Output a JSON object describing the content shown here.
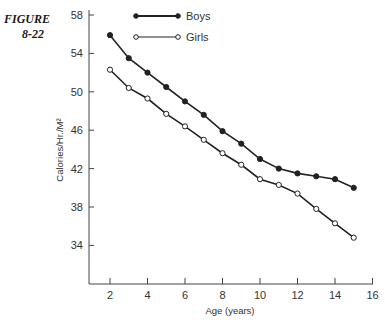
{
  "figure": {
    "label_line1": "FIGURE",
    "label_line2": "8-22"
  },
  "chart_data": {
    "type": "line",
    "title": "",
    "xlabel": "Age (years)",
    "ylabel": "Calories/Hr./M²",
    "xlim": [
      1,
      16
    ],
    "ylim": [
      30,
      58
    ],
    "x_ticks": [
      2,
      4,
      6,
      8,
      10,
      12,
      14,
      16
    ],
    "y_ticks": [
      34,
      38,
      42,
      46,
      50,
      54,
      58
    ],
    "grid": false,
    "legend_position": "top-left inside",
    "x": [
      2,
      3,
      4,
      5,
      6,
      7,
      8,
      9,
      10,
      11,
      12,
      13,
      14,
      15
    ],
    "series": [
      {
        "name": "Boys",
        "marker": "filled-circle",
        "values": [
          55.9,
          53.5,
          52.0,
          50.5,
          49.0,
          47.6,
          45.9,
          44.6,
          43.0,
          42.0,
          41.5,
          41.2,
          40.9,
          40.0
        ]
      },
      {
        "name": "Girls",
        "marker": "open-circle",
        "values": [
          52.3,
          50.4,
          49.3,
          47.7,
          46.4,
          45.0,
          43.6,
          42.4,
          40.9,
          40.3,
          39.4,
          37.8,
          36.3,
          34.8
        ]
      }
    ]
  },
  "colors": {
    "line": "#222222",
    "axis": "#444444",
    "background": "#ffffff"
  }
}
